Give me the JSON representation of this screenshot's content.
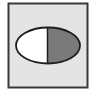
{
  "figure": {
    "colors": {
      "background": "#ffffff",
      "panel_fill": "#e4e4e4",
      "panel_border": "#3a3a3a",
      "ellipse_left_fill": "#ffffff",
      "ellipse_right_fill": "#7a7a7a",
      "ellipse_outline": "#1e1e1e"
    }
  }
}
